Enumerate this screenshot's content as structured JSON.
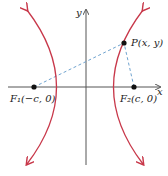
{
  "diagram": {
    "type": "hyperbola-foci",
    "axes": {
      "x_label": "x",
      "y_label": "y"
    },
    "point": {
      "label": "P(x, y)"
    },
    "focus1": {
      "label": "F₁(−c, 0)"
    },
    "focus2": {
      "label": "F₂(c, 0)"
    },
    "colors": {
      "curve": "#c8384a",
      "dashed": "#6fa3cf",
      "axis": "#555555",
      "point": "#111111"
    }
  }
}
